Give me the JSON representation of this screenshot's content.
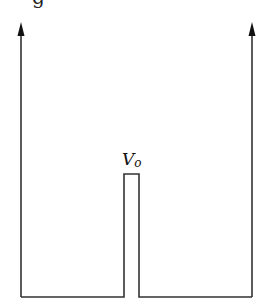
{
  "title_fragment": "g",
  "diagram": {
    "type": "potential-well-with-barrier",
    "stroke_color": "#333333",
    "barrier_label": {
      "main": "V",
      "subscript": "o"
    },
    "walls": {
      "left": {
        "x": 21,
        "top": 22,
        "bottom": 297,
        "arrow": "up"
      },
      "right": {
        "x": 252,
        "top": 22,
        "bottom": 297,
        "arrow": "up"
      }
    },
    "barrier": {
      "x_left": 124,
      "x_right": 139,
      "top": 174,
      "bottom": 297
    }
  }
}
